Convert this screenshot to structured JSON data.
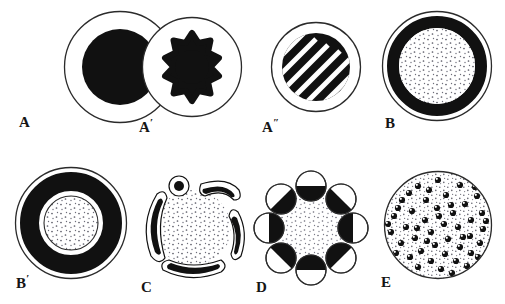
{
  "figure": {
    "kind": "scientific-line-diagram",
    "width": 505,
    "height": 304,
    "background_color": "#ffffff",
    "ink_color": "#111111",
    "stipple_color": "#5a5a66",
    "rows": 2,
    "columns": 4
  },
  "panels": [
    {
      "id": "A",
      "label": "A",
      "label_prime": "",
      "row": 0,
      "column": 0,
      "cx": 120,
      "cy": 67,
      "outer_radius": 57,
      "type": "solid-core",
      "core_radius": 38,
      "core_fill": "#111111",
      "outline_stroke": "#2b2b2b",
      "label_x": 19,
      "label_y": 112
    },
    {
      "id": "A-prime",
      "label": "A",
      "label_prime": "′",
      "row": 0,
      "column": 1,
      "cx": 192,
      "cy": 67,
      "outer_radius": 50,
      "type": "lobed-star-core",
      "lobes": 8,
      "core_outer_radius": 36,
      "core_inner_radius": 20,
      "core_fill": "#111111",
      "outline_stroke": "#2b2b2b",
      "label_x": 139,
      "label_y": 117
    },
    {
      "id": "A-double-prime",
      "label": "A",
      "label_prime": "″",
      "row": 0,
      "column": 2,
      "cx": 316,
      "cy": 67,
      "outer_radius": 45,
      "type": "hatched-core",
      "core_radius": 34,
      "core_fill": "#111111",
      "hatch_color": "#ffffff",
      "hatch_angle_deg": -45,
      "hatch_count": 9,
      "outline_stroke": "#2b2b2b",
      "label_x": 262,
      "label_y": 117
    },
    {
      "id": "B",
      "label": "B",
      "label_prime": "",
      "row": 0,
      "column": 3,
      "cx": 437,
      "cy": 66,
      "outer_radius": 55,
      "type": "thick-ring-stippled-core",
      "ring_outer_radius": 50,
      "ring_inner_radius": 38,
      "ring_fill": "#111111",
      "core_radius": 38,
      "core_fill": "stipple",
      "outline_stroke": "#2b2b2b",
      "label_x": 385,
      "label_y": 113
    },
    {
      "id": "B-prime",
      "label": "B",
      "label_prime": "′",
      "row": 1,
      "column": 0,
      "cx": 71,
      "cy": 223,
      "outer_radius": 56,
      "type": "thick-ring-gap-stippled-core",
      "ring_outer_radius": 51,
      "ring_inner_radius": 32,
      "ring_fill": "#111111",
      "gap_radius": 29,
      "core_radius": 27,
      "core_fill": "stipple",
      "outline_stroke": "#2b2b2b",
      "label_x": 16,
      "label_y": 273
    },
    {
      "id": "C",
      "label": "C",
      "label_prime": "",
      "row": 1,
      "column": 1,
      "cx": 193,
      "cy": 228,
      "outer_radius": 58,
      "type": "stippled-core-with-detached-plaques",
      "core_radius": 38,
      "core_fill": "stipple",
      "plaque_count": 5,
      "plaque_fill": "#111111",
      "plaque_halo": "#ffffff",
      "label_x": 141,
      "label_y": 277
    },
    {
      "id": "D",
      "label": "D",
      "label_prime": "",
      "row": 1,
      "column": 2,
      "cx": 311,
      "cy": 228,
      "outer_radius": 58,
      "type": "stippled-core-with-half-filled-satellites",
      "core_radius": 35,
      "core_fill": "stipple",
      "satellite_count": 8,
      "satellite_radius": 15,
      "satellite_orbit_radius": 40,
      "satellite_fill": "#111111",
      "satellite_outline": "#2b2b2b",
      "label_x": 256,
      "label_y": 277
    },
    {
      "id": "E",
      "label": "E",
      "label_prime": "",
      "row": 1,
      "column": 3,
      "cx": 437,
      "cy": 224,
      "outer_radius": 55,
      "type": "stippled-disc-with-granules",
      "core_radius": 54,
      "core_fill": "stipple",
      "granule_count": 52,
      "granule_radius": 3.1,
      "granule_fill": "#111111",
      "granule_highlight": "#ffffff",
      "outline_stroke": "#2b2b2b",
      "label_x": 381,
      "label_y": 272
    }
  ]
}
